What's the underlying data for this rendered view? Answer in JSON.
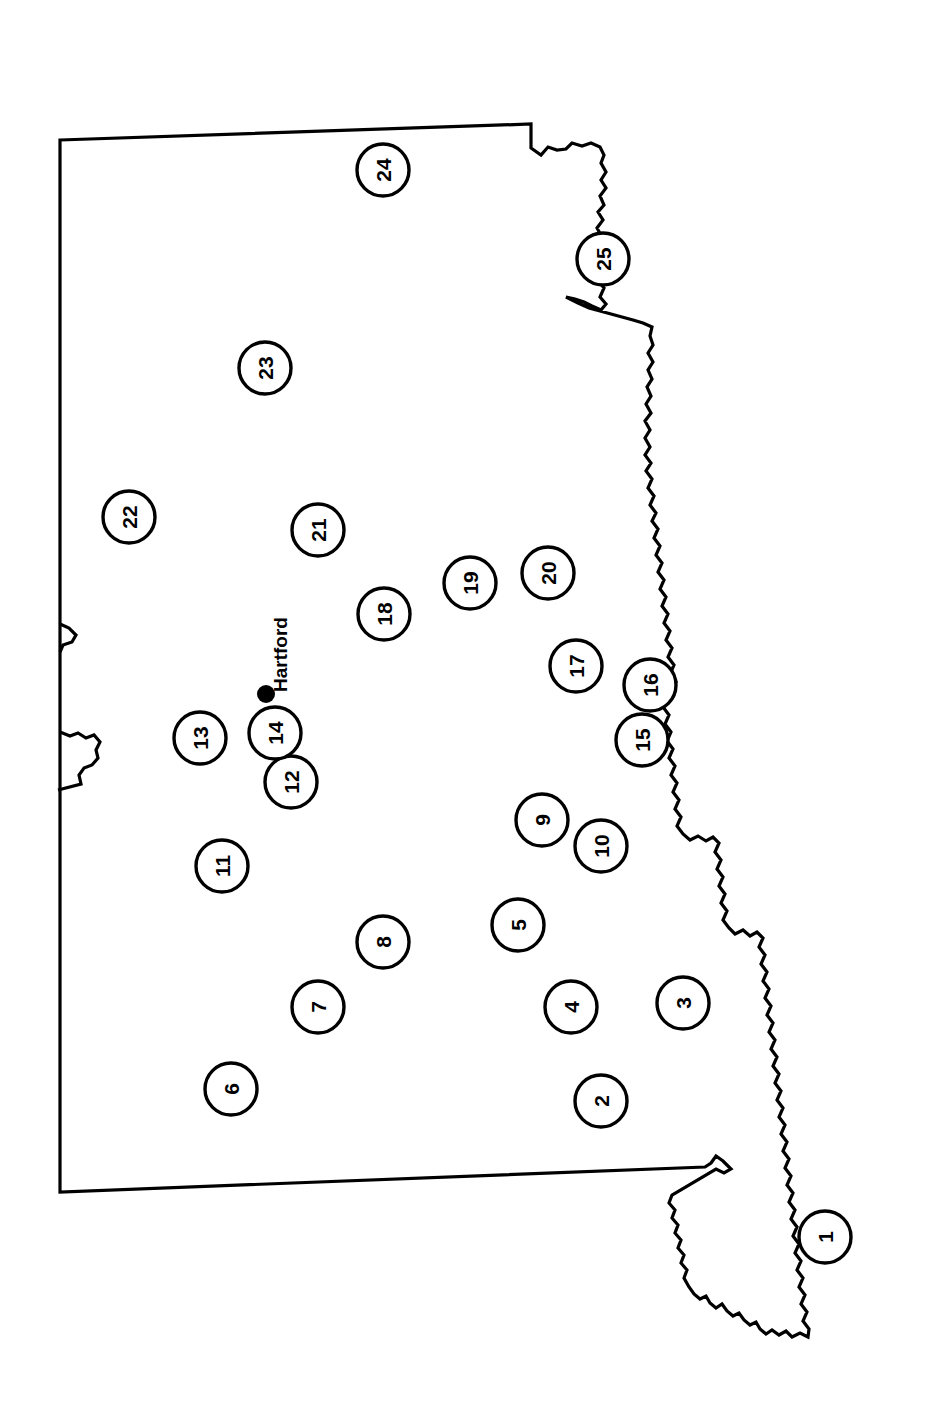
{
  "map": {
    "title": "Connecticut county reference map (rotated 90 degrees)",
    "orientation_note": "Map rendered rotated; all labels read bottom-to-top",
    "background_color": "#ffffff",
    "outline_color": "#000000",
    "label_color": "#000000",
    "city_markers": [
      {
        "name": "Hartford",
        "label": "Hartford",
        "x": 266,
        "y": 694,
        "dot_radius": 9
      }
    ],
    "numbered_markers": [
      {
        "id": "1",
        "label": "1",
        "x": 825,
        "y": 1237,
        "r": 26
      },
      {
        "id": "2",
        "label": "2",
        "x": 601,
        "y": 1101,
        "r": 26
      },
      {
        "id": "3",
        "label": "3",
        "x": 683,
        "y": 1003,
        "r": 26
      },
      {
        "id": "4",
        "label": "4",
        "x": 571,
        "y": 1007,
        "r": 26
      },
      {
        "id": "5",
        "label": "5",
        "x": 518,
        "y": 925,
        "r": 26
      },
      {
        "id": "6",
        "label": "6",
        "x": 231,
        "y": 1089,
        "r": 26
      },
      {
        "id": "7",
        "label": "7",
        "x": 318,
        "y": 1007,
        "r": 26
      },
      {
        "id": "8",
        "label": "8",
        "x": 383,
        "y": 942,
        "r": 26
      },
      {
        "id": "9",
        "label": "9",
        "x": 542,
        "y": 820,
        "r": 26
      },
      {
        "id": "10",
        "label": "10",
        "x": 601,
        "y": 846,
        "r": 26
      },
      {
        "id": "11",
        "label": "11",
        "x": 222,
        "y": 866,
        "r": 26
      },
      {
        "id": "12",
        "label": "12",
        "x": 291,
        "y": 782,
        "r": 26
      },
      {
        "id": "13",
        "label": "13",
        "x": 200,
        "y": 738,
        "r": 26
      },
      {
        "id": "14",
        "label": "14",
        "x": 275,
        "y": 733,
        "r": 26
      },
      {
        "id": "15",
        "label": "15",
        "x": 642,
        "y": 740,
        "r": 26
      },
      {
        "id": "16",
        "label": "16",
        "x": 650,
        "y": 685,
        "r": 26
      },
      {
        "id": "17",
        "label": "17",
        "x": 576,
        "y": 666,
        "r": 26
      },
      {
        "id": "18",
        "label": "18",
        "x": 384,
        "y": 614,
        "r": 26
      },
      {
        "id": "19",
        "label": "19",
        "x": 470,
        "y": 583,
        "r": 26
      },
      {
        "id": "20",
        "label": "20",
        "x": 548,
        "y": 573,
        "r": 26
      },
      {
        "id": "21",
        "label": "21",
        "x": 318,
        "y": 530,
        "r": 26
      },
      {
        "id": "22",
        "label": "22",
        "x": 129,
        "y": 517,
        "r": 26
      },
      {
        "id": "23",
        "label": "23",
        "x": 265,
        "y": 368,
        "r": 26
      },
      {
        "id": "24",
        "label": "24",
        "x": 383,
        "y": 170,
        "r": 26
      },
      {
        "id": "25",
        "label": "25",
        "x": 603,
        "y": 259,
        "r": 26
      }
    ],
    "outline_path": "M 60 140 L 531 124 L 531 148 L 541 155 L 548 147 L 557 150 L 566 149 L 572 143 L 582 146 L 591 143 L 600 147 L 604 155 L 601 163 L 606 172 L 601 180 L 606 188 L 600 196 L 604 205 L 598 212 L 603 220 L 597 228 L 602 237 L 597 245 L 602 254 L 597 262 L 603 271 L 598 280 L 604 288 L 600 297 L 606 304 L 601 310 L 592 306 L 584 302 L 575 299 L 566 297 L 578 303 L 589 308 L 600 311 L 611 314 L 622 317 L 633 320 L 643 323 L 652 327 L 650 336 L 653 345 L 648 353 L 653 362 L 648 370 L 652 379 L 647 387 L 651 396 L 646 404 L 651 413 L 645 421 L 650 430 L 645 438 L 650 447 L 645 455 L 651 463 L 646 471 L 652 479 L 648 488 L 654 496 L 650 505 L 656 513 L 652 521 L 658 529 L 654 538 L 660 546 L 656 555 L 662 563 L 658 572 L 664 580 L 660 589 L 666 597 L 662 606 L 668 614 L 664 623 L 670 631 L 666 640 L 672 648 L 668 657 L 674 665 L 670 674 L 676 682 L 672 690 L 667 683 L 661 677 L 657 684 L 662 692 L 668 699 L 663 707 L 669 715 L 665 724 L 671 732 L 667 741 L 673 749 L 669 758 L 675 766 L 671 775 L 677 783 L 673 792 L 679 800 L 675 809 L 681 817 L 677 826 L 683 834 L 690 840 L 698 836 L 706 841 L 713 837 L 719 843 L 715 852 L 721 860 L 717 869 L 723 877 L 719 886 L 725 894 L 721 903 L 727 911 L 723 920 L 729 928 L 735 934 L 743 930 L 750 936 L 757 932 L 763 938 L 759 947 L 765 955 L 761 964 L 767 972 L 763 981 L 769 989 L 765 998 L 771 1006 L 767 1015 L 773 1023 L 769 1032 L 775 1040 L 771 1049 L 777 1057 L 773 1066 L 779 1074 L 775 1083 L 781 1091 L 777 1100 L 783 1108 L 779 1117 L 785 1125 L 781 1134 L 787 1142 L 783 1151 L 789 1159 L 785 1168 L 791 1176 L 787 1185 L 793 1193 L 789 1202 L 795 1210 L 791 1219 L 797 1227 L 793 1236 L 799 1244 L 795 1253 L 801 1261 L 797 1270 L 803 1278 L 799 1287 L 805 1295 L 801 1304 L 807 1312 L 803 1321 L 809 1329 L 808 1337 L 800 1333 L 792 1337 L 786 1331 L 779 1335 L 772 1330 L 766 1334 L 760 1329 L 756 1322 L 750 1325 L 744 1320 L 739 1313 L 733 1316 L 727 1311 L 722 1304 L 716 1308 L 710 1303 L 706 1296 L 700 1299 L 694 1294 L 689 1287 L 684 1278 L 687 1270 L 681 1263 L 684 1255 L 678 1248 L 681 1240 L 675 1233 L 678 1225 L 672 1218 L 675 1210 L 669 1203 L 672 1195 L 716 1169 L 724 1173 L 731 1169 L 723 1161 L 716 1156 L 711 1163 L 705 1167 L 60 1192 Z",
    "inner_notch_path": "M 60 624 L 69 628 L 76 635 L 72 642 L 63 645 L 60 652",
    "south_notch_path": "M 60 732 L 70 736 L 78 733 L 86 738 L 94 735 L 100 742 L 96 750 L 98 758 L 92 765 L 84 768 L 79 775 L 81 784 L 58 790"
  }
}
